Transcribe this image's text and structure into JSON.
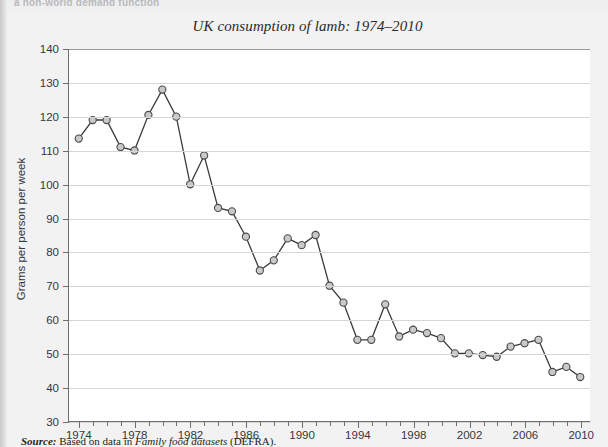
{
  "page": {
    "top_heading_partial": "a non-world demand function"
  },
  "figure": {
    "title": "UK consumption of lamb: 1974–2010",
    "source_label": "Source:",
    "source_text_before": "Based on data in",
    "source_work": "Family food datasets",
    "source_text_after": "(DEFRA)."
  },
  "axes": {
    "y_title": "Grams per person per week",
    "y_ticks": [
      30,
      40,
      50,
      60,
      70,
      80,
      90,
      100,
      110,
      120,
      130,
      140
    ],
    "x_labels": [
      1974,
      1978,
      1982,
      1986,
      1990,
      1994,
      1998,
      2002,
      2006,
      2010
    ]
  },
  "colors": {
    "page_background": "#efefef",
    "figure_background": "#f2f2f2",
    "plot_background": "#ffffff",
    "axis": "#6f6f6f",
    "gridline": "#d6d6d6",
    "line": "#3b3b3b",
    "marker_fill": "#c9c9c9",
    "marker_stroke": "#4a4a4a",
    "text": "#33383d"
  },
  "chart_data": {
    "type": "line",
    "title": "UK consumption of lamb: 1974–2010",
    "xlabel": "",
    "ylabel": "Grams per person per week",
    "xlim": [
      1973.3,
      2010.7
    ],
    "ylim": [
      30,
      140
    ],
    "grid": true,
    "legend": "none",
    "marker": "circle",
    "x": [
      1974,
      1975,
      1976,
      1977,
      1978,
      1979,
      1980,
      1981,
      1982,
      1983,
      1984,
      1985,
      1986,
      1987,
      1988,
      1989,
      1990,
      1991,
      1992,
      1993,
      1994,
      1995,
      1996,
      1997,
      1998,
      1999,
      2000,
      2001,
      2002,
      2003,
      2004,
      2005,
      2006,
      2007,
      2008,
      2009,
      2010
    ],
    "series": [
      {
        "name": "UK lamb consumption",
        "values": [
          113.5,
          119,
          119,
          111,
          110,
          120.5,
          128,
          120,
          100,
          108.5,
          93,
          92,
          84.5,
          74.5,
          77.5,
          84,
          82,
          85,
          70,
          65,
          54,
          54,
          64.5,
          55,
          57,
          56,
          54.5,
          50,
          50,
          49.5,
          49,
          52,
          53,
          54,
          44.5,
          46,
          43
        ]
      }
    ]
  }
}
